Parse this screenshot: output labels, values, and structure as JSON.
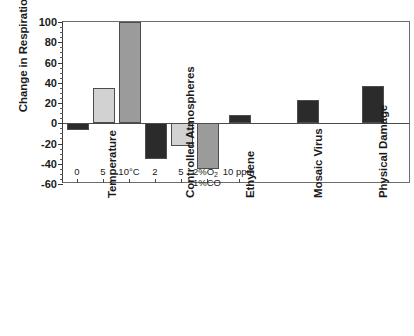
{
  "chart_data": {
    "type": "bar",
    "title": "",
    "subtitle": "",
    "xlabel": "",
    "ylabel": "Change in Respiration, %",
    "ylim": [
      -60,
      100
    ],
    "ytick_values": [
      100,
      80,
      60,
      40,
      20,
      0,
      -20,
      -40,
      -60
    ],
    "ytick_labels": [
      "100",
      "80",
      "60",
      "40",
      "20",
      "0",
      "-20",
      "-40",
      "-60"
    ],
    "minor_tick_step": 5,
    "grid": false,
    "legend": "none",
    "zero_reference_line": true,
    "orientation": "vertical",
    "panels": [
      {
        "name": "Temperature",
        "categories": [
          "0",
          "5",
          "10°C"
        ],
        "values": [
          -7,
          35,
          100
        ],
        "shades": [
          "dark",
          "light",
          "medium"
        ],
        "notes": "10°C bar reaches the top of the axis (100%)"
      },
      {
        "name": "Controlled Atmospheres",
        "categories": [
          "2",
          "5",
          "2%O₂ 1%CO"
        ],
        "values": [
          -35,
          -22,
          -45
        ],
        "shades": [
          "dark",
          "light",
          "medium"
        ]
      },
      {
        "name": "Ethylene",
        "categories": [
          "10 ppm"
        ],
        "values": [
          8
        ],
        "shades": [
          "dark"
        ]
      },
      {
        "name": "Mosaic Virus",
        "categories": [
          ""
        ],
        "values": [
          23
        ],
        "shades": [
          "dark"
        ]
      },
      {
        "name": "Physical Damage",
        "categories": [
          ""
        ],
        "values": [
          37
        ],
        "shades": [
          "dark"
        ]
      }
    ]
  },
  "colors": {
    "bar_dark": "#2b2b2b",
    "bar_light": "#d2d2d2",
    "bar_medium": "#9b9b9b",
    "axis": "#4a4a4a",
    "background": "#ffffff",
    "text": "#1a1a1a"
  },
  "axis": {
    "y_title": "Change in Respiration, %",
    "y_labels": [
      "100",
      "80",
      "60",
      "40",
      "20",
      "0",
      "-20",
      "-40",
      "-60"
    ]
  },
  "panel_labels": {
    "temperature": "Temperature",
    "controlled_atmospheres": "Controlled Atmospheres",
    "ethylene": "Ethylene",
    "mosaic_virus": "Mosaic Virus",
    "physical_damage": "Physical Damage"
  },
  "tick_labels": {
    "temp_0": "0",
    "temp_5": "5",
    "temp_10": "10°C",
    "ca_2": "2",
    "ca_5": "5",
    "ca_mix_top": "2%O",
    "ca_mix_sub": "2",
    "ca_mix_bottom": "1%CO",
    "ethylene_10ppm": "10 ppm"
  }
}
